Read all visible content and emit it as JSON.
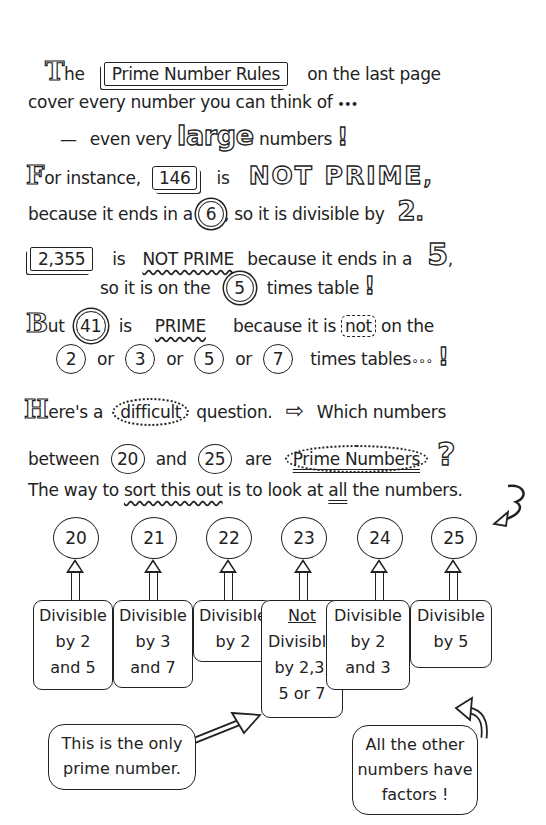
{
  "intro": {
    "line1": {
      "drop_cap": "T",
      "text_a": "he",
      "rules_box": "Prime Number Rules",
      "text_b": "on the last page"
    },
    "line2": {
      "text": "cover every number you can think of",
      "ellipsis": "•••"
    },
    "line3": {
      "dash": "—",
      "text_a": "even very",
      "large_word": "large",
      "text_b": "numbers",
      "exclaim": "!"
    }
  },
  "example1": {
    "drop_cap": "F",
    "text_a": "or instance,",
    "number": "146",
    "text_b": "is",
    "verdict": "NOT PRIME",
    "comma": ",",
    "line2_a": "because it ends in a",
    "digit": "6",
    "line2_b": ", so it is divisible by",
    "divisor": "2",
    "period": "."
  },
  "example2": {
    "number": "2,355",
    "text_a": "is",
    "verdict": "NOT PRIME",
    "text_b": "because it ends in a",
    "digit": "5",
    "comma": ",",
    "line2_a": "so it is on the",
    "table": "5",
    "line2_b": "times table",
    "exclaim": "!"
  },
  "example3": {
    "drop_cap": "B",
    "text_a": "ut",
    "number": "41",
    "text_b": "is",
    "verdict": "PRIME",
    "text_c": "because it is",
    "not_word": "not",
    "text_d": "on the",
    "tables": [
      "2",
      "3",
      "5",
      "7"
    ],
    "or_word": "or",
    "line2_end": "times tables",
    "ellipsis": "∘∘∘",
    "exclaim": "!"
  },
  "question": {
    "drop_cap": "H",
    "text_a": "ere's a",
    "difficult": "difficult",
    "text_b": "question.",
    "arrow": "⇨",
    "text_c": "Which numbers",
    "line2_a": "between",
    "from": "20",
    "and": "and",
    "to": "25",
    "are": "are",
    "prime_numbers": "Prime Numbers",
    "qmark": "?"
  },
  "method": {
    "text_a": "The way to",
    "sort": "sort this out",
    "text_b": "is to look at",
    "all": "all",
    "text_c": "the numbers."
  },
  "numbers": [
    {
      "value": "20",
      "desc": [
        "Divisible",
        "by 2",
        "and 5"
      ]
    },
    {
      "value": "21",
      "desc": [
        "Divisible",
        "by 3",
        "and 7"
      ]
    },
    {
      "value": "22",
      "desc": [
        "Divisible",
        "by 2"
      ]
    },
    {
      "value": "23",
      "desc": [
        "Not",
        "Divisible",
        "by 2,3,",
        "5 or 7"
      ]
    },
    {
      "value": "24",
      "desc": [
        "Divisible",
        "by 2",
        "and 3"
      ]
    },
    {
      "value": "25",
      "desc": [
        "Divisible",
        "by 5"
      ]
    }
  ],
  "callouts": {
    "prime": [
      "This is the only",
      "prime number."
    ],
    "others": [
      "All the other",
      "numbers have",
      "factors !"
    ]
  }
}
